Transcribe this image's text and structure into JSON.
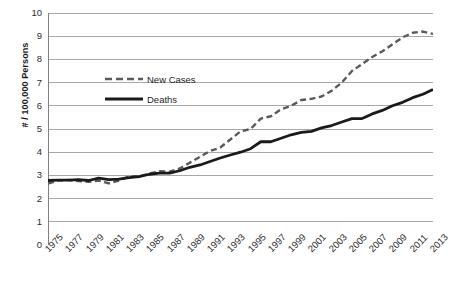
{
  "chart_data": {
    "type": "line",
    "title": "",
    "xlabel": "",
    "ylabel": "# / 100,000 Persons",
    "xlim": [
      1975,
      2013
    ],
    "ylim": [
      0,
      10
    ],
    "ytick_step": 1,
    "yticks": [
      "0",
      "1",
      "2",
      "3",
      "4",
      "5",
      "6",
      "7",
      "8",
      "9",
      "10"
    ],
    "xtick_labels": [
      "1975",
      "1977",
      "1979",
      "1981",
      "1983",
      "1985",
      "1987",
      "1989",
      "1991",
      "1993",
      "1995",
      "1997",
      "1999",
      "2001",
      "2003",
      "2005",
      "2007",
      "2009",
      "2011",
      "2013"
    ],
    "xtick_label_step": 2,
    "minor_xticks_every_year": true,
    "grid": "horizontal",
    "legend_position": "inside-upper-left",
    "x": [
      1975,
      1976,
      1977,
      1978,
      1979,
      1980,
      1981,
      1982,
      1983,
      1984,
      1985,
      1986,
      1987,
      1988,
      1989,
      1990,
      1991,
      1992,
      1993,
      1994,
      1995,
      1996,
      1997,
      1998,
      1999,
      2000,
      2001,
      2002,
      2003,
      2004,
      2005,
      2006,
      2007,
      2008,
      2009,
      2010,
      2011,
      2012,
      2013
    ],
    "series": [
      {
        "name": "New Cases",
        "style": "dashed",
        "color": "#595959",
        "values": [
          2.65,
          2.78,
          2.8,
          2.76,
          2.72,
          2.78,
          2.66,
          2.78,
          2.95,
          2.96,
          3.08,
          3.18,
          3.16,
          3.3,
          3.55,
          3.8,
          4.05,
          4.2,
          4.55,
          4.9,
          5.0,
          5.45,
          5.55,
          5.85,
          6.0,
          6.25,
          6.3,
          6.4,
          6.65,
          7.0,
          7.5,
          7.8,
          8.1,
          8.35,
          8.65,
          8.95,
          9.15,
          9.2,
          9.1
        ]
      },
      {
        "name": "Deaths",
        "style": "solid",
        "color": "#1a1a1a",
        "values": [
          2.78,
          2.8,
          2.8,
          2.82,
          2.78,
          2.88,
          2.82,
          2.84,
          2.9,
          2.95,
          3.05,
          3.1,
          3.1,
          3.2,
          3.35,
          3.45,
          3.6,
          3.75,
          3.88,
          4.0,
          4.15,
          4.45,
          4.45,
          4.6,
          4.75,
          4.85,
          4.9,
          5.05,
          5.15,
          5.3,
          5.45,
          5.45,
          5.65,
          5.8,
          6.0,
          6.15,
          6.35,
          6.5,
          6.7
        ]
      }
    ]
  },
  "legend": {
    "items": [
      {
        "label": "New Cases",
        "style": "dashed"
      },
      {
        "label": "Deaths",
        "style": "solid"
      }
    ]
  },
  "axis": {
    "y_title": "# / 100,000 Persons"
  },
  "colors": {
    "new_cases": "#595959",
    "deaths": "#1a1a1a",
    "grid": "#9e9e9e",
    "axis": "#808080",
    "background": "#ffffff"
  }
}
